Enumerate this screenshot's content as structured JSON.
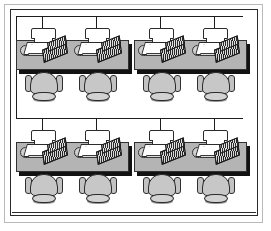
{
  "diagram": {
    "type": "network-topology",
    "topology": "bus",
    "workstation_count": 8,
    "desk_cluster_count": 4,
    "chairs_per_desk": 2,
    "computers_per_desk": 2,
    "rows": 2,
    "clusters_per_row": 2
  },
  "colors": {
    "background": "#ffffff",
    "frame_outer": "#b9b9b9",
    "frame_inner": "#2a2a2a",
    "desk_surface": "#b4b4b4",
    "desk_shadow": "#121212",
    "chair_fill": "#c7c7c7",
    "chair_outline": "#2b2b2b",
    "monitor_fill": "#ffffff",
    "keyboard_fill": "#2e2e2e",
    "cable": "#1d1d1d"
  },
  "frame": {
    "label": "picture-frame-border"
  },
  "network": {
    "backbone_label": "bus-backbone",
    "segments": [
      {
        "name": "top-backbone",
        "orientation": "horizontal"
      },
      {
        "name": "left-riser",
        "orientation": "vertical"
      },
      {
        "name": "middle-backbone",
        "orientation": "horizontal"
      }
    ],
    "drop_count": 8
  },
  "clusters": [
    {
      "id": "cluster-1",
      "row": 1,
      "position": "top-left",
      "workstations": [
        {
          "id": "ws-1",
          "label": "Workstation 1"
        },
        {
          "id": "ws-2",
          "label": "Workstation 2"
        }
      ]
    },
    {
      "id": "cluster-2",
      "row": 1,
      "position": "top-right",
      "workstations": [
        {
          "id": "ws-3",
          "label": "Workstation 3"
        },
        {
          "id": "ws-4",
          "label": "Workstation 4"
        }
      ]
    },
    {
      "id": "cluster-3",
      "row": 2,
      "position": "bottom-left",
      "workstations": [
        {
          "id": "ws-5",
          "label": "Workstation 5"
        },
        {
          "id": "ws-6",
          "label": "Workstation 6"
        }
      ]
    },
    {
      "id": "cluster-4",
      "row": 2,
      "position": "bottom-right",
      "workstations": [
        {
          "id": "ws-7",
          "label": "Workstation 7"
        },
        {
          "id": "ws-8",
          "label": "Workstation 8"
        }
      ]
    }
  ]
}
